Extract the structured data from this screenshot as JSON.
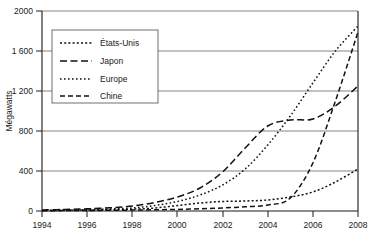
{
  "chart_data": {
    "type": "line",
    "title": "",
    "xlabel": "",
    "ylabel": "Mégawatts",
    "xlim": [
      1994,
      2008
    ],
    "ylim": [
      0,
      2000
    ],
    "grid": true,
    "legend_position": "top-left",
    "xticks": [
      "1994",
      "1996",
      "1998",
      "2000",
      "2002",
      "2004",
      "2006",
      "2008"
    ],
    "xtick_values": [
      1994,
      1996,
      1998,
      2000,
      2002,
      2004,
      2006,
      2008
    ],
    "yticks": [
      "0",
      "400",
      "800",
      "1 200",
      "1 600",
      "2000"
    ],
    "ytick_values": [
      0,
      400,
      800,
      1200,
      1600,
      2000
    ],
    "x": [
      1994,
      1995,
      1996,
      1997,
      1998,
      1999,
      2000,
      2001,
      2002,
      2003,
      2004,
      2005,
      2006,
      2007,
      2008
    ],
    "series": [
      {
        "name": "États-Unis",
        "dash": "dotted-fine",
        "values": [
          5,
          7,
          10,
          13,
          18,
          30,
          55,
          80,
          95,
          100,
          110,
          140,
          190,
          290,
          420
        ]
      },
      {
        "name": "Japon",
        "dash": "long-dash",
        "values": [
          10,
          15,
          22,
          32,
          50,
          85,
          140,
          230,
          390,
          630,
          850,
          910,
          920,
          1050,
          1250
        ]
      },
      {
        "name": "Europe",
        "dash": "dotted",
        "values": [
          6,
          9,
          14,
          20,
          30,
          55,
          95,
          160,
          260,
          420,
          660,
          950,
          1280,
          1600,
          1850
        ]
      },
      {
        "name": "Chine",
        "dash": "medium-dash",
        "values": [
          3,
          4,
          5,
          7,
          9,
          12,
          16,
          22,
          30,
          42,
          60,
          130,
          480,
          1100,
          1790
        ]
      }
    ]
  },
  "legend": {
    "entries": [
      {
        "label": "États-Unis"
      },
      {
        "label": "Japon"
      },
      {
        "label": "Europe"
      },
      {
        "label": "Chine"
      }
    ]
  }
}
